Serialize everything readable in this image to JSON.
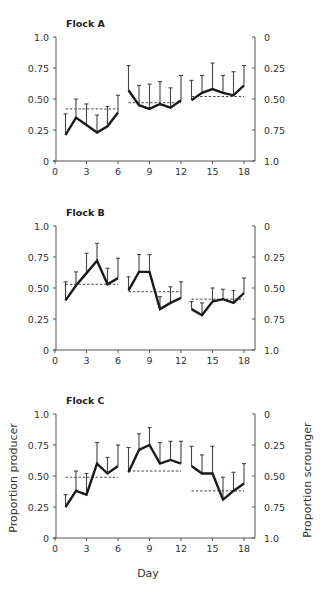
{
  "figure": {
    "xlabel": "Day",
    "ylabel_left": "Proportion producer",
    "ylabel_right": "Proportion scrounger"
  },
  "chart_data": [
    {
      "type": "line",
      "title": "Flock A",
      "xlabel": "Day",
      "ylabel": "Proportion producer",
      "ylabel_right": "Proportion scrounger",
      "xlim": [
        0,
        19
      ],
      "ylim": [
        0,
        1.0
      ],
      "x_ticks": [
        0,
        3,
        6,
        9,
        12,
        15,
        18
      ],
      "y_ticks_left": [
        "0",
        "0.25",
        "0.50",
        "0.75",
        "1.0"
      ],
      "y_ticks_right": [
        "1.0",
        "0.75",
        "0.50",
        "0.25",
        "0"
      ],
      "grid": false,
      "segments": [
        {
          "x": [
            1,
            2,
            3,
            4,
            5,
            6
          ],
          "values": [
            0.21,
            0.35,
            0.29,
            0.23,
            0.28,
            0.39
          ],
          "err_upper": [
            0.38,
            0.5,
            0.46,
            0.37,
            0.44,
            0.53
          ],
          "mean": 0.42
        },
        {
          "x": [
            7,
            8,
            9,
            10,
            11,
            12
          ],
          "values": [
            0.57,
            0.45,
            0.42,
            0.46,
            0.43,
            0.49
          ],
          "err_upper": [
            0.77,
            0.61,
            0.62,
            0.64,
            0.59,
            0.69
          ],
          "mean": 0.47
        },
        {
          "x": [
            13,
            14,
            15,
            16,
            17,
            18
          ],
          "values": [
            0.49,
            0.55,
            0.58,
            0.55,
            0.53,
            0.61
          ],
          "err_upper": [
            0.65,
            0.69,
            0.79,
            0.69,
            0.72,
            0.77
          ],
          "mean": 0.52
        }
      ]
    },
    {
      "type": "line",
      "title": "Flock B",
      "xlabel": "Day",
      "ylabel": "Proportion producer",
      "ylabel_right": "Proportion scrounger",
      "xlim": [
        0,
        19
      ],
      "ylim": [
        0,
        1.0
      ],
      "x_ticks": [
        0,
        3,
        6,
        9,
        12,
        15,
        18
      ],
      "y_ticks_left": [
        "0",
        "0.25",
        "0.50",
        "0.75",
        "1.0"
      ],
      "y_ticks_right": [
        "1.0",
        "0.75",
        "0.50",
        "0.25",
        "0"
      ],
      "grid": false,
      "segments": [
        {
          "x": [
            1,
            2,
            3,
            4,
            5,
            6
          ],
          "values": [
            0.4,
            0.52,
            0.62,
            0.72,
            0.53,
            0.58
          ],
          "err_upper": [
            0.55,
            0.63,
            0.78,
            0.86,
            0.66,
            0.74
          ],
          "mean": 0.53
        },
        {
          "x": [
            7,
            8,
            9,
            10,
            11,
            12
          ],
          "values": [
            0.48,
            0.63,
            0.63,
            0.33,
            0.38,
            0.42
          ],
          "err_upper": [
            0.59,
            0.77,
            0.77,
            0.43,
            0.51,
            0.55
          ],
          "mean": 0.47
        },
        {
          "x": [
            13,
            14,
            15,
            16,
            17,
            18
          ],
          "values": [
            0.33,
            0.28,
            0.39,
            0.41,
            0.38,
            0.46
          ],
          "err_upper": [
            0.39,
            0.38,
            0.5,
            0.49,
            0.48,
            0.58
          ],
          "mean": 0.41
        }
      ]
    },
    {
      "type": "line",
      "title": "Flock C",
      "xlabel": "Day",
      "ylabel": "Proportion producer",
      "ylabel_right": "Proportion scrounger",
      "xlim": [
        0,
        19
      ],
      "ylim": [
        0,
        1.0
      ],
      "x_ticks": [
        0,
        3,
        6,
        9,
        12,
        15,
        18
      ],
      "y_ticks_left": [
        "0",
        "0.25",
        "0.50",
        "0.75",
        "1.0"
      ],
      "y_ticks_right": [
        "1.0",
        "0.75",
        "0.50",
        "0.25",
        "0"
      ],
      "grid": false,
      "segments": [
        {
          "x": [
            1,
            2,
            3,
            4,
            5,
            6
          ],
          "values": [
            0.25,
            0.38,
            0.35,
            0.6,
            0.52,
            0.58
          ],
          "err_upper": [
            0.35,
            0.54,
            0.52,
            0.77,
            0.65,
            0.75
          ],
          "mean": 0.49
        },
        {
          "x": [
            7,
            8,
            9,
            10,
            11,
            12
          ],
          "values": [
            0.53,
            0.71,
            0.75,
            0.6,
            0.63,
            0.6
          ],
          "err_upper": [
            0.73,
            0.84,
            0.89,
            0.77,
            0.78,
            0.78
          ],
          "mean": 0.54
        },
        {
          "x": [
            13,
            14,
            15,
            16,
            17,
            18
          ],
          "values": [
            0.58,
            0.52,
            0.52,
            0.31,
            0.38,
            0.44
          ],
          "err_upper": [
            0.74,
            0.67,
            0.74,
            0.49,
            0.53,
            0.6
          ],
          "mean": 0.38
        }
      ]
    }
  ]
}
